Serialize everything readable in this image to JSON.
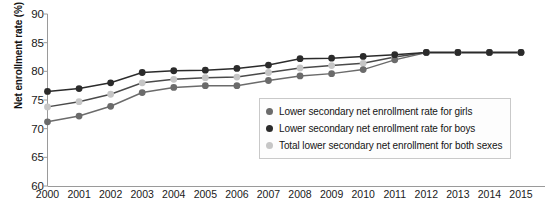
{
  "chart_data": {
    "type": "line",
    "title": "",
    "xlabel": "",
    "ylabel": "Net enrollment rate (%)",
    "categories": [
      "2000",
      "2001",
      "2002",
      "2003",
      "2004",
      "2005",
      "2006",
      "2007",
      "2008",
      "2009",
      "2010",
      "2011",
      "2012",
      "2013",
      "2014",
      "2015"
    ],
    "x": [
      2000,
      2001,
      2002,
      2003,
      2004,
      2005,
      2006,
      2007,
      2008,
      2009,
      2010,
      2011,
      2012,
      2013,
      2014,
      2015
    ],
    "ylim": [
      60,
      90
    ],
    "ytick_values": [
      60,
      65,
      70,
      75,
      80,
      85,
      90
    ],
    "ytick_labels": [
      "60",
      "65",
      "70",
      "75",
      "80",
      "85",
      "90"
    ],
    "grid": false,
    "legend_position": "center-right-inside",
    "series": [
      {
        "name": "Lower secondary net enrollment rate for girls",
        "color": "#6b6b6b",
        "values": [
          71.2,
          72.2,
          73.9,
          76.3,
          77.2,
          77.5,
          77.5,
          78.4,
          79.2,
          79.6,
          80.3,
          82.0,
          83.3,
          83.3,
          83.3,
          83.3
        ]
      },
      {
        "name": "Lower secondary net enrollment rate for boys",
        "color": "#2b2b2b",
        "values": [
          76.5,
          77.0,
          78.0,
          79.8,
          80.1,
          80.2,
          80.5,
          81.1,
          82.2,
          82.3,
          82.6,
          82.9,
          83.3,
          83.3,
          83.3,
          83.3
        ]
      },
      {
        "name": "Total lower secondary net enrollment for both sexes",
        "color": "#c6c6c6",
        "values": [
          73.8,
          74.7,
          76.0,
          78.0,
          78.6,
          78.9,
          79.0,
          79.8,
          80.6,
          81.0,
          81.4,
          82.5,
          83.3,
          83.3,
          83.3,
          83.3
        ]
      }
    ]
  },
  "axis": {
    "y_label": "Net enrollment rate (%)"
  },
  "legend": {
    "items": [
      {
        "label": "Lower secondary net enrollment rate for girls",
        "color": "#6b6b6b"
      },
      {
        "label": "Lower secondary net enrollment rate for boys",
        "color": "#2b2b2b"
      },
      {
        "label": "Total lower secondary net enrollment for both sexes",
        "color": "#c6c6c6"
      }
    ]
  }
}
